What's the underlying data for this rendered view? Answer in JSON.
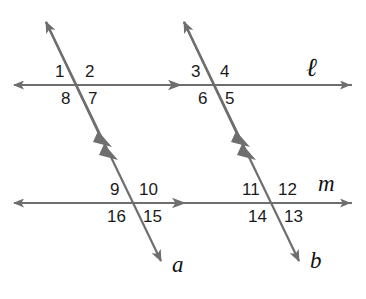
{
  "figure": {
    "stroke_color": "#6e6e6e",
    "label_color": "#1a1a1a",
    "background_color": "#ffffff"
  },
  "lines": [
    {
      "id": "line-ell",
      "label": "ℓ",
      "role": "horizontal-parallel-line-upper",
      "label_x": 306,
      "label_y": 55
    },
    {
      "id": "line-m",
      "label": "m",
      "role": "horizontal-parallel-line-lower",
      "label_x": 318,
      "label_y": 172
    },
    {
      "id": "transversal-a",
      "label": "a",
      "role": "transversal-left",
      "label_x": 172,
      "label_y": 253
    },
    {
      "id": "transversal-b",
      "label": "b",
      "role": "transversal-right",
      "label_x": 310,
      "label_y": 249
    }
  ],
  "angle_labels": [
    {
      "id": "angle-1",
      "text": "1",
      "x": 55,
      "y": 63,
      "intersection": "ell-a",
      "quadrant": "upper-left"
    },
    {
      "id": "angle-2",
      "text": "2",
      "x": 85,
      "y": 63,
      "intersection": "ell-a",
      "quadrant": "upper-right"
    },
    {
      "id": "angle-3",
      "text": "3",
      "x": 191,
      "y": 63,
      "intersection": "ell-b",
      "quadrant": "upper-left"
    },
    {
      "id": "angle-4",
      "text": "4",
      "x": 220,
      "y": 63,
      "intersection": "ell-b",
      "quadrant": "upper-right"
    },
    {
      "id": "angle-5",
      "text": "5",
      "x": 225,
      "y": 90,
      "intersection": "ell-b",
      "quadrant": "lower-right"
    },
    {
      "id": "angle-6",
      "text": "6",
      "x": 198,
      "y": 90,
      "intersection": "ell-b",
      "quadrant": "lower-left"
    },
    {
      "id": "angle-7",
      "text": "7",
      "x": 88,
      "y": 90,
      "intersection": "ell-a",
      "quadrant": "lower-right"
    },
    {
      "id": "angle-8",
      "text": "8",
      "x": 61,
      "y": 90,
      "intersection": "ell-a",
      "quadrant": "lower-left"
    },
    {
      "id": "angle-9",
      "text": "9",
      "x": 110,
      "y": 181,
      "intersection": "m-a",
      "quadrant": "upper-left"
    },
    {
      "id": "angle-10",
      "text": "10",
      "x": 139,
      "y": 181,
      "intersection": "m-a",
      "quadrant": "upper-right"
    },
    {
      "id": "angle-11",
      "text": "11",
      "x": 242,
      "y": 181,
      "intersection": "m-b",
      "quadrant": "upper-left"
    },
    {
      "id": "angle-12",
      "text": "12",
      "x": 278,
      "y": 181,
      "intersection": "m-b",
      "quadrant": "upper-right"
    },
    {
      "id": "angle-13",
      "text": "13",
      "x": 284,
      "y": 208,
      "intersection": "m-b",
      "quadrant": "lower-right"
    },
    {
      "id": "angle-14",
      "text": "14",
      "x": 248,
      "y": 208,
      "intersection": "m-b",
      "quadrant": "lower-left"
    },
    {
      "id": "angle-15",
      "text": "15",
      "x": 143,
      "y": 208,
      "intersection": "m-a",
      "quadrant": "lower-right"
    },
    {
      "id": "angle-16",
      "text": "16",
      "x": 107,
      "y": 208,
      "intersection": "m-a",
      "quadrant": "lower-left"
    }
  ],
  "markers": {
    "parallel_tick_count_per_transversal": 2,
    "direction_arrow_on_line_ell": "right",
    "direction_arrow_on_line_m": "right"
  }
}
